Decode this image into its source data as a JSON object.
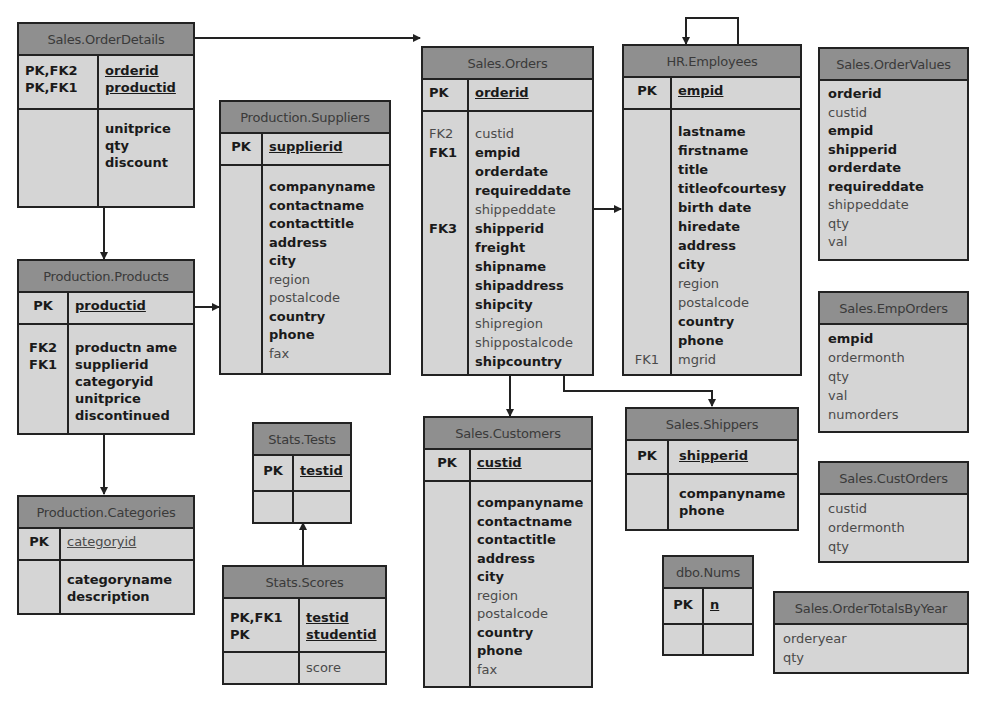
{
  "tables": {
    "orderdetails": {
      "title": "Sales.OrderDetails",
      "pk": [
        {
          "key": "PK,FK2",
          "field": "orderid"
        },
        {
          "key": "PK,FK1",
          "field": "productid"
        }
      ],
      "fields": [
        {
          "key": "",
          "field": "unitprice",
          "bold": true
        },
        {
          "key": "",
          "field": "qty",
          "bold": true
        },
        {
          "key": "",
          "field": "discount",
          "bold": true
        }
      ]
    },
    "products": {
      "title": "Production.Products",
      "pk": [
        {
          "key": "PK",
          "field": "productid"
        }
      ],
      "fields": [
        {
          "key": "",
          "field": "productn ame",
          "bold": true
        },
        {
          "key": "FK2",
          "field": "supplierid",
          "bold": true
        },
        {
          "key": "FK1",
          "field": "categoryid",
          "bold": true
        },
        {
          "key": "",
          "field": "unitprice",
          "bold": true
        },
        {
          "key": "",
          "field": "discontinued",
          "bold": true
        }
      ]
    },
    "categories": {
      "title": "Production.Categories",
      "pk": [
        {
          "key": "PK",
          "field": "categoryid"
        }
      ],
      "fields": [
        {
          "key": "",
          "field": "categoryname",
          "bold": true
        },
        {
          "key": "",
          "field": "description",
          "bold": true
        }
      ]
    },
    "suppliers": {
      "title": "Production.Suppliers",
      "pk": [
        {
          "key": "PK",
          "field": "supplierid"
        }
      ],
      "fields": [
        {
          "key": "",
          "field": "companyname",
          "bold": true
        },
        {
          "key": "",
          "field": "contactname",
          "bold": true
        },
        {
          "key": "",
          "field": "contacttitle",
          "bold": true
        },
        {
          "key": "",
          "field": "address",
          "bold": true
        },
        {
          "key": "",
          "field": "city",
          "bold": true
        },
        {
          "key": "",
          "field": "region",
          "bold": false
        },
        {
          "key": "",
          "field": "postalcode",
          "bold": false
        },
        {
          "key": "",
          "field": "country",
          "bold": true
        },
        {
          "key": "",
          "field": "phone",
          "bold": true
        },
        {
          "key": "",
          "field": "fax",
          "bold": false
        }
      ]
    },
    "tests": {
      "title": "Stats.Tests",
      "pk": [
        {
          "key": "PK",
          "field": "testid"
        }
      ],
      "fields": []
    },
    "scores": {
      "title": "Stats.Scores",
      "pk": [
        {
          "key": "PK,FK1",
          "field": "testid"
        },
        {
          "key": "PK",
          "field": "studentid"
        }
      ],
      "fields": [
        {
          "key": "",
          "field": "score",
          "bold": false
        }
      ]
    },
    "orders": {
      "title": "Sales.Orders",
      "pk": [
        {
          "key": "PK",
          "field": "orderid"
        }
      ],
      "fields": [
        {
          "key": "FK2",
          "field": "custid",
          "bold": false
        },
        {
          "key": "FK1",
          "field": "empid",
          "bold": true
        },
        {
          "key": "",
          "field": "orderdate",
          "bold": true
        },
        {
          "key": "",
          "field": "requireddate",
          "bold": true
        },
        {
          "key": "",
          "field": "shippeddate",
          "bold": false
        },
        {
          "key": "FK3",
          "field": "shipperid",
          "bold": true
        },
        {
          "key": "",
          "field": "freight",
          "bold": true
        },
        {
          "key": "",
          "field": "shipname",
          "bold": true
        },
        {
          "key": "",
          "field": "shipaddress",
          "bold": true
        },
        {
          "key": "",
          "field": "shipcity",
          "bold": true
        },
        {
          "key": "",
          "field": "shipregion",
          "bold": false
        },
        {
          "key": "",
          "field": "shippostalcode",
          "bold": false
        },
        {
          "key": "",
          "field": "shipcountry",
          "bold": true
        }
      ]
    },
    "customers": {
      "title": "Sales.Customers",
      "pk": [
        {
          "key": "PK",
          "field": "custid"
        }
      ],
      "fields": [
        {
          "key": "",
          "field": "companyname",
          "bold": true
        },
        {
          "key": "",
          "field": "contactname",
          "bold": true
        },
        {
          "key": "",
          "field": "contactitle",
          "bold": true
        },
        {
          "key": "",
          "field": "address",
          "bold": true
        },
        {
          "key": "",
          "field": "city",
          "bold": true
        },
        {
          "key": "",
          "field": "region",
          "bold": false
        },
        {
          "key": "",
          "field": "postalcode",
          "bold": false
        },
        {
          "key": "",
          "field": "country",
          "bold": true
        },
        {
          "key": "",
          "field": "phone",
          "bold": true
        },
        {
          "key": "",
          "field": "fax",
          "bold": false
        }
      ]
    },
    "employees": {
      "title": "HR.Employees",
      "pk": [
        {
          "key": "PK",
          "field": "empid"
        }
      ],
      "fields": [
        {
          "key": "",
          "field": "lastname",
          "bold": true
        },
        {
          "key": "",
          "field": "firstname",
          "bold": true
        },
        {
          "key": "",
          "field": "title",
          "bold": true
        },
        {
          "key": "",
          "field": "titleofcourtesy",
          "bold": true
        },
        {
          "key": "",
          "field": "birth date",
          "bold": true
        },
        {
          "key": "",
          "field": "hiredate",
          "bold": true
        },
        {
          "key": "",
          "field": "address",
          "bold": true
        },
        {
          "key": "",
          "field": "city",
          "bold": true
        },
        {
          "key": "",
          "field": "region",
          "bold": false
        },
        {
          "key": "",
          "field": "postalcode",
          "bold": false
        },
        {
          "key": "",
          "field": "country",
          "bold": true
        },
        {
          "key": "",
          "field": "phone",
          "bold": true
        },
        {
          "key": "FK1",
          "field": "mgrid",
          "bold": false
        }
      ]
    },
    "shippers": {
      "title": "Sales.Shippers",
      "pk": [
        {
          "key": "PK",
          "field": "shipperid"
        }
      ],
      "fields": [
        {
          "key": "",
          "field": "companyname",
          "bold": true
        },
        {
          "key": "",
          "field": "phone",
          "bold": true
        }
      ]
    },
    "nums": {
      "title": "dbo.Nums",
      "pk": [
        {
          "key": "PK",
          "field": "n"
        }
      ],
      "fields": []
    },
    "ordervalues": {
      "title": "Sales.OrderValues",
      "fields": [
        {
          "field": "orderid",
          "bold": true
        },
        {
          "field": "custid",
          "bold": false
        },
        {
          "field": "empid",
          "bold": true
        },
        {
          "field": "shipperid",
          "bold": true
        },
        {
          "field": "orderdate",
          "bold": true
        },
        {
          "field": "requireddate",
          "bold": true
        },
        {
          "field": "shippeddate",
          "bold": false
        },
        {
          "field": "qty",
          "bold": false
        },
        {
          "field": "val",
          "bold": false
        }
      ]
    },
    "emporders": {
      "title": "Sales.EmpOrders",
      "fields": [
        {
          "field": "empid",
          "bold": true
        },
        {
          "field": "ordermonth",
          "bold": false
        },
        {
          "field": "qty",
          "bold": false
        },
        {
          "field": "val",
          "bold": false
        },
        {
          "field": "numorders",
          "bold": false
        }
      ]
    },
    "custorders": {
      "title": "Sales.CustOrders",
      "fields": [
        {
          "field": "custid",
          "bold": false
        },
        {
          "field": "ordermonth",
          "bold": false
        },
        {
          "field": "qty",
          "bold": false
        }
      ]
    },
    "ordertotalsbyyear": {
      "title": "Sales.OrderTotalsByYear",
      "fields": [
        {
          "field": "orderyear",
          "bold": false
        },
        {
          "field": "qty",
          "bold": false
        }
      ]
    }
  },
  "relationships": [
    {
      "from": "Sales.OrderDetails",
      "to": "Sales.Orders"
    },
    {
      "from": "Sales.OrderDetails",
      "to": "Production.Products"
    },
    {
      "from": "Production.Products",
      "to": "Production.Suppliers"
    },
    {
      "from": "Production.Products",
      "to": "Production.Categories"
    },
    {
      "from": "Stats.Scores",
      "to": "Stats.Tests"
    },
    {
      "from": "Sales.Orders",
      "to": "HR.Employees"
    },
    {
      "from": "Sales.Orders",
      "to": "Sales.Customers"
    },
    {
      "from": "Sales.Orders",
      "to": "Sales.Shippers"
    },
    {
      "from": "HR.Employees",
      "to": "HR.Employees"
    }
  ],
  "colors": {
    "header": "#8f8f8f",
    "body": "#d5d5d5",
    "border": "#222222"
  }
}
